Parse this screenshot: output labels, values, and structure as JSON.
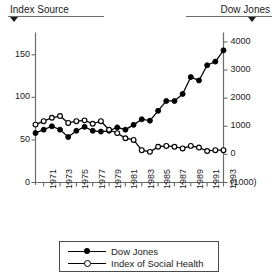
{
  "header": {
    "left_label": "Index Source",
    "right_label": "Dow Jones",
    "left_marker_icon": "triangle-down-icon",
    "right_marker_icon": "triangle-down-icon"
  },
  "legend": {
    "items": [
      {
        "label": "Dow Jones",
        "marker": "filled-circle",
        "color": "#000000"
      },
      {
        "label": "Index of Social Health",
        "marker": "open-circle",
        "color": "#000000"
      }
    ]
  },
  "chart_data": {
    "type": "line",
    "title": "",
    "xlabel": "",
    "ylabel": "",
    "grid": false,
    "legend_position": "bottom",
    "x": [
      1970,
      1971,
      1972,
      1973,
      1974,
      1975,
      1976,
      1977,
      1978,
      1979,
      1980,
      1981,
      1982,
      1983,
      1984,
      1985,
      1986,
      1987,
      1988,
      1989,
      1990,
      1991,
      1992,
      1993
    ],
    "xtick_labels": [
      "1971",
      "1973",
      "1975",
      "1977",
      "1979",
      "1981",
      "1983",
      "1985",
      "1987",
      "1989",
      "1991",
      "1993"
    ],
    "xtick_values": [
      1971,
      1973,
      1975,
      1977,
      1979,
      1981,
      1983,
      1985,
      1987,
      1989,
      1991,
      1993
    ],
    "xlim": [
      1970,
      1993
    ],
    "axes": [
      {
        "id": "left",
        "name": "Index of Social Health",
        "tick_labels": [
          "0",
          "50",
          "100",
          "150"
        ],
        "tick_values": [
          0,
          50,
          100,
          150
        ],
        "ylim": [
          0,
          175
        ]
      },
      {
        "id": "right",
        "name": "Dow Jones",
        "tick_labels": [
          "(1000)",
          "0",
          "1000",
          "2000",
          "3000",
          "4000"
        ],
        "tick_values": [
          -1000,
          0,
          1000,
          2000,
          3000,
          4000
        ],
        "ylim": [
          -1000,
          4300
        ]
      }
    ],
    "series": [
      {
        "name": "Dow Jones",
        "axis": "right",
        "marker": "filled-circle",
        "color": "#000000",
        "values": [
          760,
          880,
          1000,
          880,
          620,
          840,
          980,
          840,
          810,
          840,
          960,
          880,
          1050,
          1250,
          1200,
          1550,
          1900,
          1900,
          2150,
          2750,
          2630,
          3170,
          3300,
          3700
        ]
      },
      {
        "name": "Index of Social Health",
        "axis": "left",
        "marker": "open-circle",
        "color": "#000000",
        "values": [
          68,
          72,
          76,
          78,
          70,
          72,
          73,
          69,
          72,
          62,
          58,
          52,
          50,
          38,
          36,
          42,
          43,
          42,
          40,
          43,
          41,
          37,
          38,
          38
        ]
      }
    ]
  }
}
